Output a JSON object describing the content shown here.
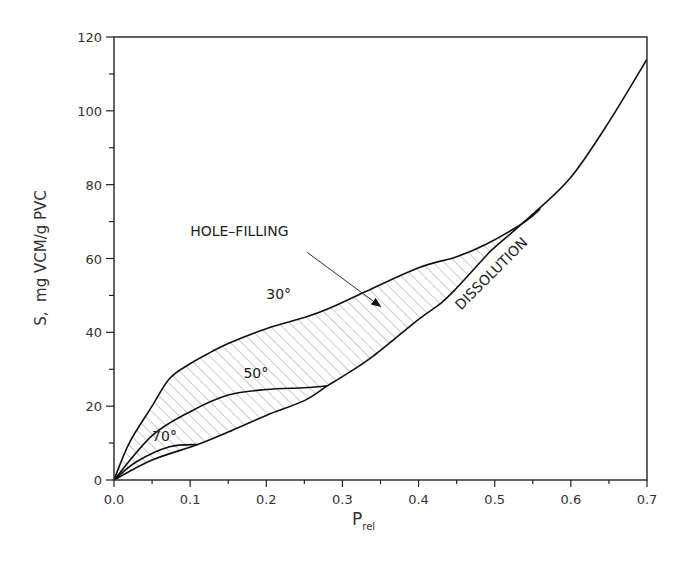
{
  "chart_data": {
    "type": "line",
    "title": "",
    "xlabel": "P",
    "xlabel_sub": "rel",
    "ylabel": "S,  mg VCM/g PVC",
    "xlim": [
      0,
      0.7
    ],
    "ylim": [
      0,
      120
    ],
    "x_ticks": [
      "0.0",
      "0.1",
      "0.2",
      "0.3",
      "0.4",
      "0.5",
      "0.6",
      "0.7"
    ],
    "x_tick_values": [
      0,
      0.1,
      0.2,
      0.3,
      0.4,
      0.5,
      0.6,
      0.7
    ],
    "x_minor_step": 0.05,
    "y_ticks": [
      "0",
      "20",
      "40",
      "60",
      "80",
      "100",
      "120"
    ],
    "y_tick_values": [
      0,
      20,
      40,
      60,
      80,
      100,
      120
    ],
    "y_minor_step": 10,
    "grid": false,
    "legend": "none",
    "series": [
      {
        "name": "30°",
        "x": [
          0,
          0.02,
          0.05,
          0.073,
          0.1,
          0.126,
          0.15,
          0.2,
          0.25,
          0.283,
          0.33,
          0.4,
          0.45,
          0.49,
          0.54,
          0.56
        ],
        "y": [
          0,
          10,
          20,
          27.5,
          31.5,
          34.5,
          37,
          41,
          44,
          46.5,
          51,
          57.5,
          60.5,
          64,
          70,
          73.5
        ]
      },
      {
        "name": "50°",
        "x": [
          0,
          0.05,
          0.1,
          0.15,
          0.2,
          0.25,
          0.28
        ],
        "y": [
          0,
          12,
          18.5,
          23,
          24.5,
          25,
          25.5
        ]
      },
      {
        "name": "70°",
        "x": [
          0,
          0.03,
          0.073,
          0.11
        ],
        "y": [
          0,
          5,
          9,
          9.6
        ]
      },
      {
        "name": "DISSOLUTION",
        "x": [
          0,
          0.05,
          0.11,
          0.15,
          0.2,
          0.25,
          0.28,
          0.3,
          0.34,
          0.4,
          0.43,
          0.45,
          0.49,
          0.5,
          0.55,
          0.6,
          0.65,
          0.7
        ],
        "y": [
          0,
          5.4,
          9.6,
          13,
          17.5,
          21.5,
          25.5,
          28,
          33.5,
          43.5,
          48,
          52,
          61,
          63,
          72,
          82,
          97,
          114
        ]
      }
    ],
    "hatched_region": {
      "description": "Region between 30° curve and DISSOLUTION curve is hatched",
      "upper": "30°",
      "lower": "DISSOLUTION",
      "hatch_color": "#9a9a9a"
    },
    "annotations": [
      {
        "text": "HOLE–FILLING",
        "x": 0.1,
        "y": 66,
        "arrow_to": [
          0.35,
          47
        ]
      },
      {
        "text": "30°",
        "x": 0.2,
        "y": 49
      },
      {
        "text": "50°",
        "x": 0.17,
        "y": 27.5
      },
      {
        "text": "70°",
        "x": 0.05,
        "y": 10.5
      },
      {
        "text": "DISSOLUTION",
        "x": 0.5,
        "y": 55,
        "rotation": -45
      }
    ]
  }
}
